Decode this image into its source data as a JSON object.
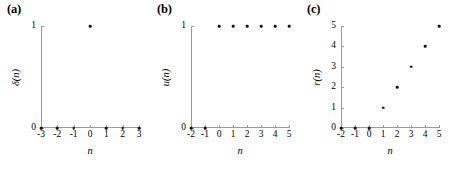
{
  "figure": {
    "background": "#ffffff",
    "axis_color": "#9a9a9a",
    "marker_color": "#111111"
  },
  "chart_data": [
    {
      "type": "scatter",
      "panel_label": "(a)",
      "title": "",
      "xlabel": "n",
      "ylabel": "δ(n)",
      "x": [
        -3,
        -2,
        -1,
        0,
        1,
        2,
        3
      ],
      "values": [
        0,
        0,
        0,
        1,
        0,
        0,
        0
      ],
      "xticks": [
        -3,
        -2,
        -1,
        0,
        1,
        2,
        3
      ],
      "xtick_labels": [
        "-3",
        "-2",
        "-1",
        "0",
        "1",
        "2",
        "3"
      ],
      "yticks": [
        0,
        1
      ],
      "ytick_labels": [
        "0",
        "1"
      ],
      "xlim": [
        -3,
        3
      ],
      "ylim": [
        0,
        1
      ],
      "grid": false,
      "legend": "none"
    },
    {
      "type": "scatter",
      "panel_label": "(b)",
      "title": "",
      "xlabel": "n",
      "ylabel": "u(n)",
      "x": [
        -2,
        -1,
        0,
        1,
        2,
        3,
        4,
        5
      ],
      "values": [
        0,
        0,
        1,
        1,
        1,
        1,
        1,
        1
      ],
      "xticks": [
        -2,
        -1,
        0,
        1,
        2,
        3,
        4,
        5
      ],
      "xtick_labels": [
        "-2",
        "-1",
        "0",
        "1",
        "2",
        "3",
        "4",
        "5"
      ],
      "yticks": [
        0,
        1
      ],
      "ytick_labels": [
        "0",
        "1"
      ],
      "xlim": [
        -2,
        5
      ],
      "ylim": [
        0,
        1
      ],
      "grid": false,
      "legend": "none"
    },
    {
      "type": "scatter",
      "panel_label": "(c)",
      "title": "",
      "xlabel": "n",
      "ylabel": "r(n)",
      "x": [
        -2,
        -1,
        0,
        1,
        2,
        3,
        4,
        5
      ],
      "values": [
        0,
        0,
        0,
        1,
        2,
        3,
        4,
        5
      ],
      "xticks": [
        -2,
        -1,
        0,
        1,
        2,
        3,
        4,
        5
      ],
      "xtick_labels": [
        "-2",
        "-1",
        "0",
        "1",
        "2",
        "3",
        "4",
        "5"
      ],
      "yticks": [
        0,
        1,
        2,
        3,
        4,
        5
      ],
      "ytick_labels": [
        "0",
        "1",
        "2",
        "3",
        "4",
        "5"
      ],
      "xlim": [
        -2,
        5
      ],
      "ylim": [
        0,
        5
      ],
      "grid": false,
      "legend": "none"
    }
  ]
}
